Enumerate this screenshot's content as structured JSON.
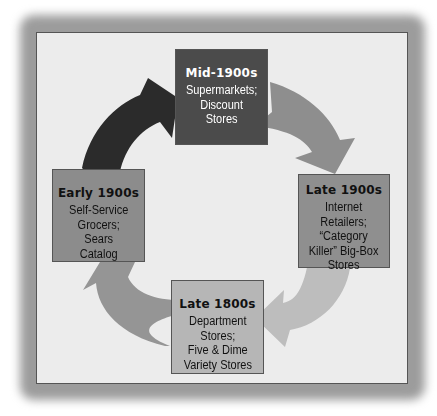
{
  "diagram": {
    "type": "cycle",
    "stages": [
      {
        "id": "mid-1900s",
        "era": "Mid-1900s",
        "lines": [
          "Supermarkets;",
          "Discount",
          "Stores"
        ],
        "fill": "#4b4b4b"
      },
      {
        "id": "late-1900s",
        "era": "Late 1900s",
        "lines": [
          "Internet",
          "Retailers;",
          "“Category",
          "Killer” Big-Box",
          "Stores"
        ],
        "fill": "#8f8f8f"
      },
      {
        "id": "late-1800s",
        "era": "Late 1800s",
        "lines": [
          "Department",
          "Stores;",
          "Five & Dime",
          "Variety Stores"
        ],
        "fill": "#b6b6b6"
      },
      {
        "id": "early-1900s",
        "era": "Early 1900s",
        "lines": [
          "Self-Service",
          "Grocers;",
          "Sears",
          "Catalog"
        ],
        "fill": "#8c8c8c"
      }
    ],
    "arrows": [
      {
        "from": "early-1900s",
        "to": "mid-1900s",
        "color": "#2b2b2b"
      },
      {
        "from": "mid-1900s",
        "to": "late-1900s",
        "color": "#8e8e8e"
      },
      {
        "from": "late-1900s",
        "to": "late-1800s",
        "color": "#bdbdbd"
      },
      {
        "from": "late-1800s",
        "to": "early-1900s",
        "color": "#959595"
      }
    ],
    "panel_color": "#ececec"
  }
}
